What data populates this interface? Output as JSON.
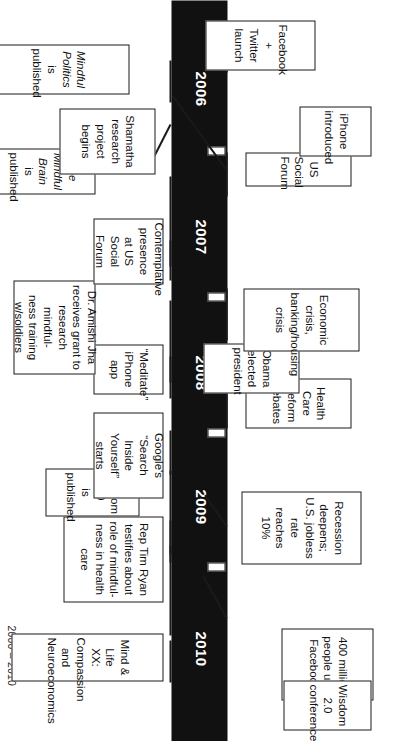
{
  "figure": {
    "range_label": "2000 – 2010",
    "caption_faint": "",
    "accent_color": "#111111",
    "box_border_color": "#1a1a1a",
    "background_color": "#ffffff",
    "year_text_color": "#ffffff"
  },
  "timeline": {
    "years": [
      {
        "label": "2006"
      },
      {
        "label": "2007"
      },
      {
        "label": "2008"
      },
      {
        "label": "2009"
      },
      {
        "label": "2010"
      }
    ]
  },
  "events": {
    "facebook_400m": "400 million\npeople use\nFacebook",
    "recession": "Recession deepens;\nU.S. jobless rate\nreaches 10%",
    "health_care": "Health Care\nReform debates",
    "obama": "Obama elected\npresident",
    "economic_crisis": "Economic crisis,\nbanking/housing\ncrisis",
    "us_social_forum": "US Social Forum",
    "iphone": "iPhone\nintroduced",
    "facebook_twitter": "Facebook +\nTwitter launch",
    "wisdom_conf": "Wisdom 2.0\nconference",
    "mind_life": "Mind & Life XX: Compassion\nand Neuroeconomics",
    "rep_tim_ryan": "Rep Tim Ryan\ntestifies about\nrole of mindful-\nness in health\ncare",
    "wisdom_published": "Wisdom 2.0\nis published",
    "google_sit": "Google's\n“Search\nInside\nYourself”\nstarts",
    "meditate_app": "“Meditate”\niPhone app",
    "amishi_jha": "Dr. Amishi Jha\nreceives grant to\nresearch mindful-\nness training\nw/soldiers",
    "contemplative": "Contemplative\npresence at US\nSocial Forum",
    "mindful_brain_title": "The Mindful Brain",
    "mindful_brain_rest": "is published",
    "shamatha": "Shamatha\nresearch\nproject begins",
    "mindful_politics_title": "Mindful Politics",
    "mindful_politics_rest": "is published"
  }
}
